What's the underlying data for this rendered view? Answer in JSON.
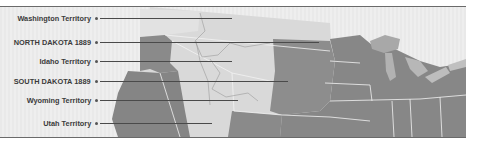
{
  "map": {
    "title": "",
    "region": "Western and Midwestern United States",
    "labels": [
      {
        "id": "washington",
        "text": "Washington Territory",
        "y": 18,
        "line_end_x": 232
      },
      {
        "id": "north-dakota",
        "text": "NORTH DAKOTA 1889",
        "y": 42,
        "line_end_x": 319
      },
      {
        "id": "idaho",
        "text": "Idaho Territory",
        "y": 61,
        "line_end_x": 232
      },
      {
        "id": "south-dakota",
        "text": "SOUTH DAKOTA 1889",
        "y": 81,
        "line_end_x": 288
      },
      {
        "id": "wyoming",
        "text": "Wyoming Territory",
        "y": 100,
        "line_end_x": 238
      },
      {
        "id": "utah",
        "text": "Utah Territory",
        "y": 123,
        "line_end_x": 212
      }
    ],
    "colors": {
      "background": "#ebebeb",
      "territory_light": "#d7d7d7",
      "state_dark": "#888888",
      "water": "#b4b4b4",
      "border_line": "#6a6a6a",
      "leader_line": "#4a4a4a",
      "label_text": "#3b3b3b"
    }
  }
}
